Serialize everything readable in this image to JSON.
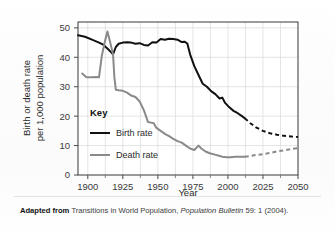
{
  "chart_data": {
    "type": "line",
    "title": "",
    "xlabel": "Year",
    "ylabel": "Birth or death rate per 1,000 population",
    "ylabel_line1": "Birth or death rate",
    "ylabel_line2": "per 1,000 population",
    "xlim": [
      1893,
      2050
    ],
    "ylim": [
      0,
      52
    ],
    "xticks": [
      1900,
      1925,
      1950,
      1975,
      2000,
      2025,
      2050
    ],
    "xtick_labels": [
      "1900",
      "1925",
      "1950",
      "1975",
      "2000",
      "2025",
      "2050"
    ],
    "yticks": [
      0,
      10,
      20,
      30,
      40,
      50
    ],
    "ytick_labels": [
      "0",
      "10",
      "20",
      "30",
      "40",
      "50"
    ],
    "grid": true,
    "grid_color": "#d8d8d8",
    "legend_position": "inside-left",
    "legend_title": "Key",
    "series": [
      {
        "name": "Birth rate",
        "color": "#111111",
        "width": 2.0,
        "solid": [
          [
            1893,
            47.5
          ],
          [
            1898,
            47.0
          ],
          [
            1903,
            46.0
          ],
          [
            1908,
            45.0
          ],
          [
            1911,
            44.3
          ],
          [
            1914,
            43.0
          ],
          [
            1916,
            42.0
          ],
          [
            1918,
            41.0
          ],
          [
            1920,
            43.5
          ],
          [
            1922,
            44.6
          ],
          [
            1925,
            45.0
          ],
          [
            1928,
            45.1
          ],
          [
            1931,
            45.0
          ],
          [
            1934,
            44.6
          ],
          [
            1937,
            44.8
          ],
          [
            1940,
            44.2
          ],
          [
            1943,
            44.0
          ],
          [
            1946,
            45.1
          ],
          [
            1949,
            45.0
          ],
          [
            1952,
            46.2
          ],
          [
            1955,
            46.0
          ],
          [
            1958,
            46.3
          ],
          [
            1961,
            46.2
          ],
          [
            1964,
            46.0
          ],
          [
            1967,
            45.2
          ],
          [
            1969,
            45.3
          ],
          [
            1971,
            44.7
          ],
          [
            1973,
            41.0
          ],
          [
            1976,
            37.0
          ],
          [
            1979,
            34.0
          ],
          [
            1982,
            31.0
          ],
          [
            1985,
            30.0
          ],
          [
            1988,
            28.5
          ],
          [
            1991,
            27.5
          ],
          [
            1994,
            26.0
          ],
          [
            1996,
            26.3
          ],
          [
            1998,
            24.5
          ],
          [
            2001,
            23.0
          ],
          [
            2004,
            21.8
          ],
          [
            2007,
            21.0
          ],
          [
            2010,
            20.0
          ],
          [
            2012,
            19.3
          ]
        ],
        "dashed": [
          [
            2012,
            19.3
          ],
          [
            2016,
            17.6
          ],
          [
            2020,
            16.2
          ],
          [
            2025,
            15.0
          ],
          [
            2030,
            14.2
          ],
          [
            2035,
            13.7
          ],
          [
            2040,
            13.3
          ],
          [
            2045,
            13.1
          ],
          [
            2050,
            12.9
          ]
        ],
        "projection_start_year": 2012,
        "projection_end_value": 12.9
      },
      {
        "name": "Death rate",
        "color": "#8a8a8a",
        "width": 2.0,
        "solid": [
          [
            1896,
            34.5
          ],
          [
            1899,
            33.2
          ],
          [
            1903,
            33.2
          ],
          [
            1906,
            33.3
          ],
          [
            1908,
            33.2
          ],
          [
            1910,
            40.5
          ],
          [
            1912,
            45.0
          ],
          [
            1914,
            48.8
          ],
          [
            1916,
            45.0
          ],
          [
            1918,
            41.0
          ],
          [
            1919,
            33.0
          ],
          [
            1920,
            29.0
          ],
          [
            1922,
            28.8
          ],
          [
            1925,
            28.6
          ],
          [
            1928,
            28.0
          ],
          [
            1931,
            27.0
          ],
          [
            1934,
            26.5
          ],
          [
            1937,
            25.0
          ],
          [
            1940,
            22.0
          ],
          [
            1943,
            18.0
          ],
          [
            1945,
            17.8
          ],
          [
            1947,
            17.6
          ],
          [
            1949,
            16.0
          ],
          [
            1952,
            15.0
          ],
          [
            1955,
            14.0
          ],
          [
            1958,
            13.2
          ],
          [
            1961,
            12.3
          ],
          [
            1964,
            11.5
          ],
          [
            1967,
            11.0
          ],
          [
            1970,
            10.0
          ],
          [
            1973,
            9.0
          ],
          [
            1976,
            8.5
          ],
          [
            1979,
            10.0
          ],
          [
            1981,
            9.0
          ],
          [
            1984,
            8.0
          ],
          [
            1987,
            7.4
          ],
          [
            1990,
            7.0
          ],
          [
            1993,
            6.6
          ],
          [
            1996,
            6.2
          ],
          [
            1999,
            6.0
          ],
          [
            2002,
            6.0
          ],
          [
            2005,
            6.2
          ],
          [
            2008,
            6.2
          ],
          [
            2012,
            6.2
          ]
        ],
        "dashed": [
          [
            2012,
            6.2
          ],
          [
            2016,
            6.5
          ],
          [
            2020,
            6.8
          ],
          [
            2025,
            7.1
          ],
          [
            2030,
            7.5
          ],
          [
            2035,
            8.0
          ],
          [
            2040,
            8.4
          ],
          [
            2045,
            8.8
          ],
          [
            2050,
            9.1
          ]
        ],
        "projection_start_year": 2012,
        "projection_end_value": 9.1
      }
    ],
    "annotations": []
  },
  "caption": {
    "prefix": "Adapted from ",
    "source_title": "Transitions in World Population, ",
    "source_italic": "Population Bulletin",
    "source_rest": " 59: 1 (2004)."
  }
}
